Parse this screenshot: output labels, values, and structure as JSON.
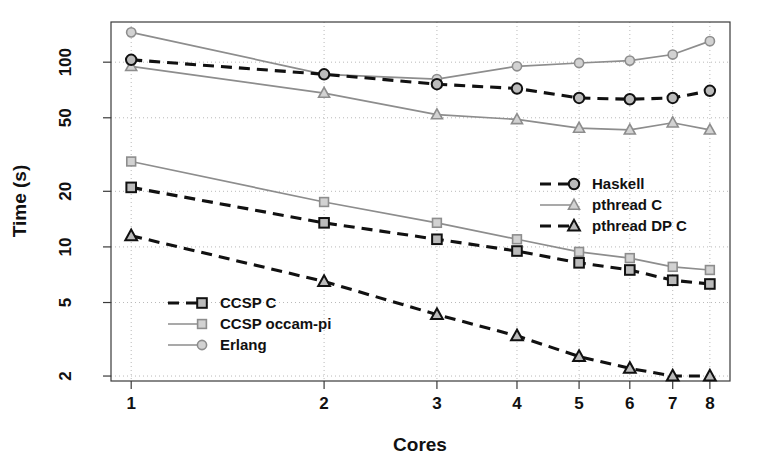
{
  "chart_data": {
    "type": "line",
    "title": "",
    "xlabel": "Cores",
    "ylabel": "Time (s)",
    "x": [
      1,
      2,
      3,
      4,
      5,
      6,
      7,
      8
    ],
    "xticklabels": [
      "1",
      "2",
      "3",
      "4",
      "5",
      "6",
      "7",
      "8"
    ],
    "yticklabels": [
      "100",
      "50",
      "20",
      "10",
      "5",
      "2"
    ],
    "yticks": [
      100,
      50,
      20,
      10,
      5,
      2
    ],
    "xscale": "log",
    "yscale": "log",
    "xlim": [
      0.93,
      8.6
    ],
    "ylim": [
      1.88,
      165
    ],
    "grid": true,
    "grid_style": "dotted",
    "legend_position": "two-blocks: lower-left and middle-right",
    "series": [
      {
        "name": "Haskell",
        "values": [
          103,
          86,
          76,
          72,
          64,
          63,
          64,
          70
        ],
        "color": "#111111",
        "linestyle": "dashed",
        "marker": "circle",
        "marker_fill": "#bbbbbb",
        "legend_block": "right"
      },
      {
        "name": "pthread C",
        "values": [
          95,
          68,
          52,
          49,
          44,
          43,
          47,
          43
        ],
        "color": "#8d8d8d",
        "linestyle": "solid",
        "marker": "triangle",
        "marker_fill": "#d2d2d2",
        "legend_block": "right"
      },
      {
        "name": "pthread DP C",
        "values": [
          11.5,
          6.5,
          4.3,
          3.3,
          2.55,
          2.2,
          2.0,
          2.0
        ],
        "color": "#111111",
        "linestyle": "dashed",
        "marker": "triangle",
        "marker_fill": "#bbbbbb",
        "legend_block": "right"
      },
      {
        "name": "CCSP C",
        "values": [
          21,
          13.5,
          11,
          9.5,
          8.2,
          7.5,
          6.6,
          6.3
        ],
        "color": "#111111",
        "linestyle": "dashed",
        "marker": "square",
        "marker_fill": "#bbbbbb",
        "legend_block": "left"
      },
      {
        "name": "CCSP occam-pi",
        "values": [
          29,
          17.5,
          13.5,
          11,
          9.4,
          8.7,
          7.8,
          7.5
        ],
        "color": "#8d8d8d",
        "linestyle": "solid",
        "marker": "square",
        "marker_fill": "#d2d2d2",
        "legend_block": "left"
      },
      {
        "name": "Erlang",
        "values": [
          145,
          86,
          81,
          95,
          99,
          102,
          110,
          130
        ],
        "color": "#8d8d8d",
        "linestyle": "solid",
        "marker": "circle",
        "marker_fill": "#d2d2d2",
        "legend_block": "left"
      }
    ]
  },
  "axes": {
    "x_title": "Cores",
    "y_title": "Time (s)"
  },
  "legend_left": {
    "items": [
      "CCSP C",
      "CCSP occam-pi",
      "Erlang"
    ]
  },
  "legend_right": {
    "items": [
      "Haskell",
      "pthread C",
      "pthread DP C"
    ]
  }
}
